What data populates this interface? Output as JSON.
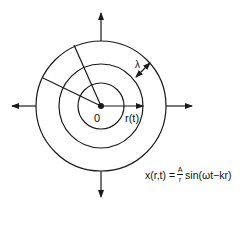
{
  "diagram": {
    "type": "spherical-wave-fronts",
    "center_label": "0",
    "radius_label": "r(t)",
    "wavelength_label": "λ",
    "equation": {
      "lhs": "x(r,t) = ",
      "numerator": "A",
      "denominator": "r",
      "rhs": " sin(ωt−kr)"
    },
    "circles": 3,
    "arrows": [
      "up",
      "down",
      "left",
      "right"
    ],
    "stroke_color": "#1a1a1a"
  }
}
